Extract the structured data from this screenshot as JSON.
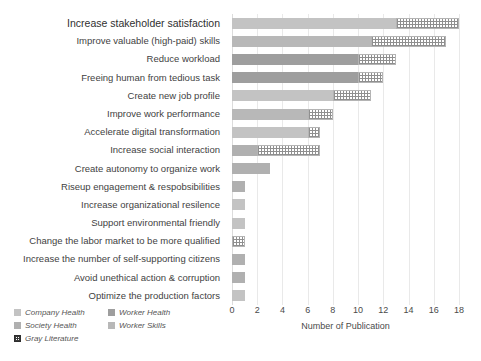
{
  "chart_data": {
    "type": "bar",
    "orientation": "horizontal",
    "stacked": true,
    "title": "",
    "xlabel": "Number of Publication",
    "ylabel": "",
    "xlim": [
      0,
      18
    ],
    "xticks": [
      0,
      2,
      4,
      6,
      8,
      10,
      12,
      14,
      16,
      18
    ],
    "grid": true,
    "legend_position": "bottom-left",
    "categories": [
      "Increase stakeholder satisfaction",
      "Improve valuable (high-paid) skills",
      "Reduce workload",
      "Freeing human from tedious task",
      "Create new job profile",
      "Improve work performance",
      "Accelerate digital transformation",
      "Increase social interaction",
      "Create autonomy to organize work",
      "Riseup engagement & respobsibilities",
      "Increase organizational resilence",
      "Support environmental friendly",
      "Change the labor market to be more qualified",
      "Increase the number of self-supporting citizens",
      "Avoid unethical action & corruption",
      "Optimize the production factors"
    ],
    "series": [
      {
        "name": "Company Health",
        "color": "#c3c3c3",
        "values": [
          13,
          0,
          0,
          0,
          8,
          0,
          6,
          0,
          0,
          0,
          1,
          1,
          0,
          0,
          0,
          1
        ]
      },
      {
        "name": "Worker Health",
        "color": "#9e9e9e",
        "values": [
          0,
          0,
          10,
          10,
          0,
          0,
          0,
          0,
          0,
          0,
          0,
          0,
          0,
          0,
          0,
          0
        ]
      },
      {
        "name": "Society Health",
        "color": "#b0b0b0",
        "values": [
          0,
          0,
          0,
          0,
          0,
          0,
          0,
          2,
          3,
          1,
          0,
          0,
          0,
          1,
          1,
          0
        ]
      },
      {
        "name": "Worker Skills",
        "color": "#b8b8b8",
        "values": [
          0,
          11,
          0,
          0,
          0,
          6,
          0,
          0,
          0,
          0,
          0,
          0,
          0,
          0,
          0,
          0
        ]
      },
      {
        "name": "Gray Literature",
        "color": "#ffffff",
        "hatched": true,
        "values": [
          5,
          6,
          3,
          2,
          3,
          2,
          1,
          5,
          0,
          0,
          0,
          0,
          1,
          0,
          0,
          0
        ]
      }
    ],
    "totals": [
      18,
      17,
      13,
      12,
      11,
      8,
      7,
      7,
      3,
      1,
      1,
      1,
      1,
      1,
      1,
      1
    ]
  },
  "legend": {
    "items": [
      {
        "label": "Company Health",
        "swatch": "company-health-swatch"
      },
      {
        "label": "Worker Health",
        "swatch": "worker-health-swatch"
      },
      {
        "label": "Society Health",
        "swatch": "society-health-swatch"
      },
      {
        "label": "Worker Skills",
        "swatch": "worker-skills-swatch"
      },
      {
        "label": "Gray Literature",
        "swatch": "gray-literature-swatch"
      }
    ]
  }
}
